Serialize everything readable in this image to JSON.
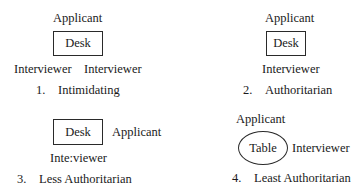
{
  "diagrams": [
    {
      "number": "1.",
      "caption": "Intimidating",
      "applicant": "Applicant",
      "furniture": "Desk",
      "interviewers": [
        "Interviewer",
        "Interviewer"
      ]
    },
    {
      "number": "2.",
      "caption": "Authoritarian",
      "applicant": "Applicant",
      "furniture": "Desk",
      "interviewers": [
        "Interviewer"
      ]
    },
    {
      "number": "3.",
      "caption": "Less Authoritarian",
      "applicant": "Applicant",
      "furniture": "Desk",
      "interviewers": [
        "Inte:viewer"
      ]
    },
    {
      "number": "4.",
      "caption": "Least Authoritarian",
      "applicant": "Applicant",
      "furniture": "Table",
      "interviewers": [
        "Interviewer"
      ]
    }
  ]
}
